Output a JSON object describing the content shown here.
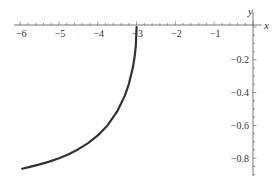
{
  "chart_data": {
    "type": "line",
    "title": "",
    "xlabel": "x",
    "ylabel": "y",
    "xlim": [
      -6.1,
      0
    ],
    "ylim": [
      -0.9,
      0
    ],
    "grid": false,
    "legend": null,
    "x_ticks": [
      -6,
      -5,
      -4,
      -3,
      -2,
      -1
    ],
    "x_tick_labels": [
      "−6",
      "−5",
      "−4",
      "−3",
      "−2",
      "−1"
    ],
    "y_ticks": [
      -0.2,
      -0.4,
      -0.6,
      -0.8
    ],
    "y_tick_labels": [
      "−0.2",
      "−0.4",
      "−0.6",
      "−0.8"
    ],
    "series": [
      {
        "name": "curve",
        "color": "#333333",
        "x": [
          -3.0,
          -3.02,
          -3.05,
          -3.1,
          -3.2,
          -3.3,
          -3.5,
          -3.75,
          -4.0,
          -4.25,
          -4.5,
          -4.75,
          -5.0,
          -5.25,
          -5.5,
          -5.75,
          -5.95
        ],
        "y": [
          0.0,
          -0.115,
          -0.18,
          -0.252,
          -0.348,
          -0.417,
          -0.515,
          -0.6,
          -0.661,
          -0.708,
          -0.745,
          -0.776,
          -0.8,
          -0.821,
          -0.838,
          -0.853,
          -0.864
        ]
      }
    ]
  },
  "axes": {
    "x_label": "x",
    "y_label": "y"
  }
}
